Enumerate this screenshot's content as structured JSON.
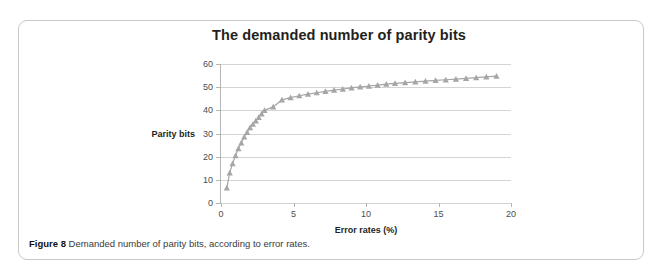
{
  "figure": {
    "caption_label": "Figure 8",
    "caption_text": "Demanded number of parity bits, according to error rates."
  },
  "colors": {
    "series": "#a6a6a6",
    "grid": "#d4d4d4",
    "axis": "#b4b4b4",
    "title_text": "#231f20",
    "card_border": "#c9c9c9"
  },
  "chart_data": {
    "type": "line",
    "title": "The demanded number of parity bits",
    "xlabel": "Error rates (%)",
    "ylabel": "Parity bits",
    "xlim": [
      0,
      20
    ],
    "ylim": [
      0,
      60
    ],
    "xticks": [
      0,
      5,
      10,
      15,
      20
    ],
    "yticks": [
      0,
      10,
      20,
      30,
      40,
      50,
      60
    ],
    "grid": "horizontal",
    "legend": "none",
    "marker": "triangle",
    "series": [
      {
        "name": "Parity bits",
        "x": [
          0.4,
          0.6,
          0.8,
          1.0,
          1.2,
          1.4,
          1.6,
          1.8,
          2.0,
          2.2,
          2.4,
          2.6,
          2.8,
          3.0,
          3.6,
          4.2,
          4.8,
          5.4,
          6.0,
          6.6,
          7.2,
          7.8,
          8.4,
          9.0,
          9.6,
          10.2,
          10.8,
          11.4,
          12.0,
          12.7,
          13.4,
          14.1,
          14.8,
          15.5,
          16.2,
          16.9,
          17.6,
          18.3,
          19.0
        ],
        "values": [
          6.5,
          13.0,
          17.0,
          20.5,
          23.5,
          26.0,
          28.5,
          30.5,
          32.5,
          34.0,
          35.5,
          37.0,
          38.5,
          40.0,
          41.5,
          44.5,
          45.5,
          46.3,
          47.0,
          47.6,
          48.2,
          48.7,
          49.2,
          49.7,
          50.1,
          50.5,
          50.9,
          51.3,
          51.6,
          52.0,
          52.3,
          52.6,
          52.9,
          53.2,
          53.5,
          53.8,
          54.1,
          54.4,
          54.8
        ]
      }
    ]
  }
}
